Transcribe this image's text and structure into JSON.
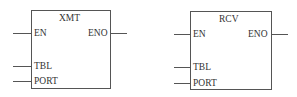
{
  "blocks": [
    {
      "title": "XMT",
      "inputs": [
        "EN",
        "TBL",
        "PORT"
      ],
      "output": "ENO"
    },
    {
      "title": "RCV",
      "inputs": [
        "EN",
        "TBL",
        "PORT"
      ],
      "output": "ENO"
    }
  ]
}
